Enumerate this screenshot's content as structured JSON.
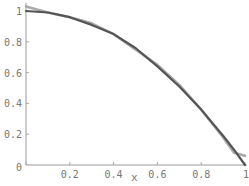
{
  "chart_data": {
    "type": "line",
    "title": "",
    "xlabel": "x",
    "ylabel": "",
    "xlim": [
      0,
      1
    ],
    "ylim": [
      0,
      1.04
    ],
    "grid": false,
    "legend": null,
    "x_ticks": [
      "0",
      "0.2",
      "0.4",
      "0.6",
      "0.8",
      "1"
    ],
    "y_ticks": [
      "0.2",
      "0.4",
      "0.6",
      "0.8",
      "1"
    ],
    "x": [
      0,
      0.1,
      0.2,
      0.3,
      0.4,
      0.5,
      0.6,
      0.7,
      0.8,
      0.9,
      0.95,
      1.0
    ],
    "series": [
      {
        "name": "exact",
        "color": "#555555",
        "values": [
          1.0,
          0.99,
          0.96,
          0.91,
          0.85,
          0.76,
          0.64,
          0.51,
          0.36,
          0.19,
          0.1,
          0.0
        ]
      },
      {
        "name": "approximation",
        "color": "#aaaaaa",
        "values": [
          1.03,
          0.99,
          0.96,
          0.92,
          0.85,
          0.75,
          0.65,
          0.52,
          0.36,
          0.18,
          0.08,
          0.06
        ]
      }
    ]
  },
  "axes": {
    "x_axis_label": "x",
    "origin_label": "0"
  }
}
